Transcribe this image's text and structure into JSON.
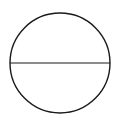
{
  "diagram": {
    "shape": "circle-with-diameter",
    "circle": {
      "cx": 60,
      "cy": 63,
      "r": 50,
      "stroke": "#1a1a1a",
      "fill": "#ffffff",
      "stroke_width": 1.4
    },
    "diameter": {
      "x1": 10,
      "y1": 63,
      "x2": 110,
      "y2": 63,
      "stroke": "#1a1a1a",
      "stroke_width": 1.1
    },
    "background": "#ffffff"
  }
}
